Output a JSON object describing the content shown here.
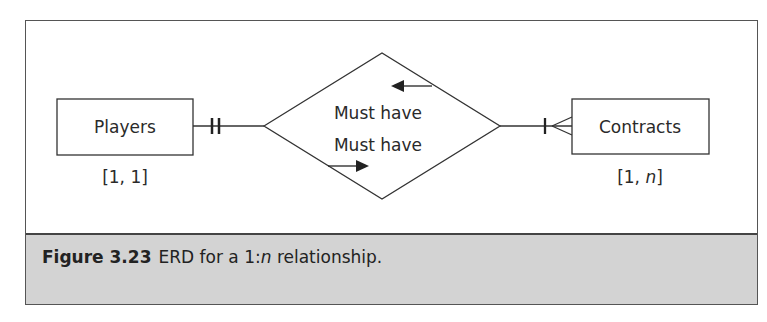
{
  "diagram": {
    "type": "entity-relationship-diagram",
    "entities": [
      {
        "name": "Players",
        "cardinality": "[1, 1]",
        "connector": "one-and-only-one"
      },
      {
        "name": "Contracts",
        "cardinality_prefix": "[1, ",
        "cardinality_var": "n",
        "cardinality_suffix": "]",
        "connector": "one-or-many"
      }
    ],
    "relationship": {
      "shape": "diamond",
      "line1": "Must have",
      "line2": "Must have",
      "arrow_top": "left",
      "arrow_bottom": "right"
    }
  },
  "caption": {
    "label": "Figure 3.23",
    "text_prefix": "ERD for a 1:",
    "text_var": "n",
    "text_suffix": " relationship."
  },
  "colors": {
    "caption_bg": "#d3d3d3",
    "line": "#333333"
  }
}
